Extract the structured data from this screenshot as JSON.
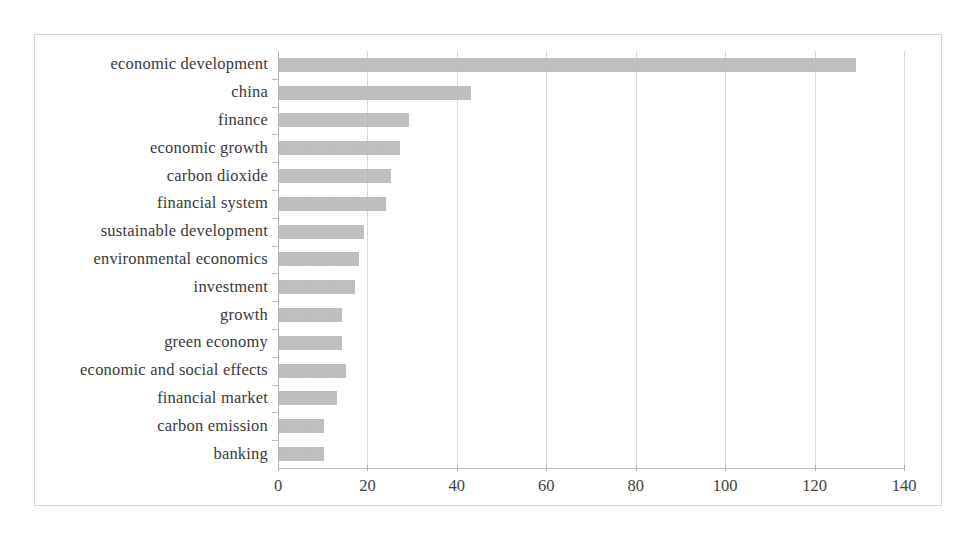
{
  "chart_data": {
    "type": "bar",
    "orientation": "horizontal",
    "title": "",
    "subtitle": "",
    "xlabel": "",
    "ylabel": "",
    "xlim": [
      0,
      140
    ],
    "xticks": [
      0,
      20,
      40,
      60,
      80,
      100,
      120,
      140
    ],
    "xtick_labels": [
      "0",
      "20",
      "40",
      "60",
      "80",
      "100",
      "120",
      "140"
    ],
    "grid": true,
    "legend": false,
    "legend_position": "none",
    "bar_color": "#a9a9a9",
    "categories": [
      "economic development",
      "china",
      "finance",
      "economic growth",
      "carbon dioxide",
      "financial system",
      "sustainable development",
      "environmental economics",
      "investment",
      "growth",
      "green economy",
      "economic and social effects",
      "financial market",
      "carbon emission",
      "banking"
    ],
    "values": [
      129,
      43,
      29,
      27,
      25,
      24,
      19,
      18,
      17,
      14,
      14,
      15,
      13,
      10,
      10
    ]
  },
  "figure": {
    "background_color": "#ffffff",
    "frame_color": "#d4d4d4",
    "gridline_color": "#d9d9d9",
    "axis_color": "#b8b8b8",
    "text_color": "#3a3a3a"
  }
}
